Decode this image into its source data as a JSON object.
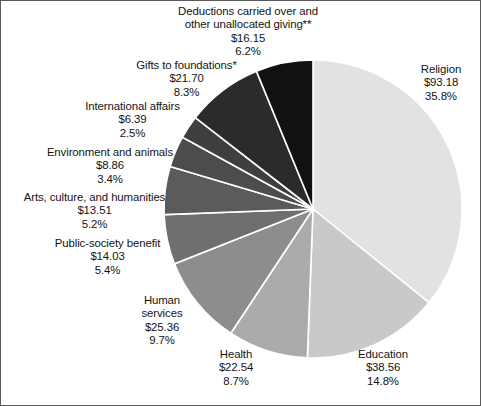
{
  "figure": {
    "type": "pie-chart",
    "background_color": "#ffffff",
    "border_color": "#5a5a5a",
    "slice_divider_color": "#ffffff",
    "center": {
      "x": 312,
      "y": 208
    },
    "radius": 149,
    "start_angle_deg": 0,
    "direction": "clockwise"
  },
  "chart_data": {
    "type": "pie",
    "title": "",
    "subtitle": "",
    "xlabel": "",
    "ylabel": "",
    "grid": false,
    "legend_position": "none",
    "value_prefix": "$",
    "labels": [
      "Religion",
      "Education",
      "Health",
      "Human services",
      "Public-society benefit",
      "Arts, culture, and humanities",
      "Environment and animals",
      "International affairs",
      "Gifts to foundations*",
      "Deductions carried over and other unallocated giving**"
    ],
    "values": [
      93.18,
      38.56,
      22.54,
      25.36,
      14.03,
      13.51,
      8.86,
      6.39,
      21.7,
      16.15
    ],
    "percents": [
      35.8,
      14.8,
      8.7,
      9.7,
      5.4,
      5.2,
      3.4,
      2.5,
      8.3,
      6.2
    ],
    "colors": [
      "#e2e2e2",
      "#c9c9c9",
      "#ababab",
      "#8d8d8d",
      "#6f6f6f",
      "#5b5b5b",
      "#4c4c4c",
      "#3f3f3f",
      "#2b2b2b",
      "#111111"
    ],
    "annotations": [
      "* Gifts to foundations",
      "** Deductions carried over and other unallocated giving"
    ]
  },
  "slices": [
    {
      "id": "religion",
      "name": "Religion",
      "value_text": "$93.18",
      "percent_text": "35.8%",
      "color": "#e2e2e2",
      "label_lines": [
        "Religion",
        "$93.18",
        "35.8%"
      ]
    },
    {
      "id": "education",
      "name": "Education",
      "value_text": "$38.56",
      "percent_text": "14.8%",
      "color": "#c9c9c9",
      "label_lines": [
        "Education",
        "$38.56",
        "14.8%"
      ]
    },
    {
      "id": "health",
      "name": "Health",
      "value_text": "$22.54",
      "percent_text": "8.7%",
      "color": "#ababab",
      "label_lines": [
        "Health",
        "$22.54",
        "8.7%"
      ]
    },
    {
      "id": "human-services",
      "name": "Human services",
      "value_text": "$25.36",
      "percent_text": "9.7%",
      "color": "#8d8d8d",
      "label_lines": [
        "Human",
        "services",
        "$25.36",
        "9.7%"
      ]
    },
    {
      "id": "public-society-benefit",
      "name": "Public-society benefit",
      "value_text": "$14.03",
      "percent_text": "5.4%",
      "color": "#6f6f6f",
      "label_lines": [
        "Public-society benefit",
        "$14.03",
        "5.4%"
      ]
    },
    {
      "id": "arts-culture-humanities",
      "name": "Arts, culture, and humanities",
      "value_text": "$13.51",
      "percent_text": "5.2%",
      "color": "#5b5b5b",
      "label_lines": [
        "Arts, culture, and humanities",
        "$13.51",
        "5.2%"
      ]
    },
    {
      "id": "environment-animals",
      "name": "Environment and animals",
      "value_text": "$8.86",
      "percent_text": "3.4%",
      "color": "#4c4c4c",
      "label_lines": [
        "Environment and animals",
        "$8.86",
        "3.4%"
      ]
    },
    {
      "id": "international-affairs",
      "name": "International affairs",
      "value_text": "$6.39",
      "percent_text": "2.5%",
      "color": "#3f3f3f",
      "label_lines": [
        "International affairs",
        "$6.39",
        "2.5%"
      ]
    },
    {
      "id": "gifts-to-foundations",
      "name": "Gifts to foundations*",
      "value_text": "$21.70",
      "percent_text": "8.3%",
      "color": "#2b2b2b",
      "label_lines": [
        "Gifts to foundations*",
        "$21.70",
        "8.3%"
      ]
    },
    {
      "id": "deductions-unallocated",
      "name": "Deductions carried over and other unallocated giving**",
      "value_text": "$16.15",
      "percent_text": "6.2%",
      "color": "#111111",
      "label_lines": [
        "Deductions carried over and",
        "other unallocated giving**",
        "$16.15",
        "6.2%"
      ]
    }
  ],
  "labels_layout": [
    {
      "id": "deductions-unallocated",
      "x": 147,
      "y": 4,
      "w": 200,
      "align": "center"
    },
    {
      "id": "gifts-to-foundations",
      "x": 113,
      "y": 58,
      "w": 145,
      "align": "center"
    },
    {
      "id": "international-affairs",
      "x": 60,
      "y": 99,
      "w": 143,
      "align": "center"
    },
    {
      "id": "environment-animals",
      "x": 24,
      "y": 145,
      "w": 170,
      "align": "center"
    },
    {
      "id": "arts-culture-humanities",
      "x": 3,
      "y": 190,
      "w": 181,
      "align": "center"
    },
    {
      "id": "public-society-benefit",
      "x": 30,
      "y": 236,
      "w": 153,
      "align": "center"
    },
    {
      "id": "human-services",
      "x": 118,
      "y": 293,
      "w": 86,
      "align": "center"
    },
    {
      "id": "health",
      "x": 196,
      "y": 347,
      "w": 78,
      "align": "center"
    },
    {
      "id": "education",
      "x": 336,
      "y": 347,
      "w": 92,
      "align": "center"
    },
    {
      "id": "religion",
      "x": 404,
      "y": 62,
      "w": 72,
      "align": "center"
    }
  ]
}
